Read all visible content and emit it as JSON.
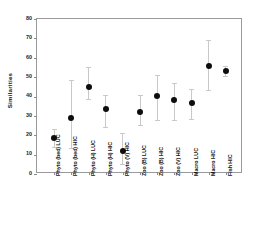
{
  "chart_data": {
    "type": "scatter",
    "title": "",
    "xlabel": "",
    "ylabel": "Similarities",
    "ylim": [
      0,
      80
    ],
    "yticks": [
      0,
      10,
      20,
      30,
      40,
      50,
      60,
      70,
      80
    ],
    "grid": false,
    "legend": "none",
    "error_bars": "vertical, capped, light gray",
    "marker": "filled black circle",
    "categories": [
      "Phyto (bed) LUC",
      "Phyto (bed) HIC",
      "Phyto (H) LUC",
      "Phyto (H) HIC",
      "Phyto (V) HIC",
      "Zoo (B) LUC",
      "Zoo (B) HIC",
      "Zoo (V) HIC",
      "Macro LUC",
      "Macro HIC",
      "Fish HIC"
    ],
    "values": [
      18.5,
      29.0,
      45.0,
      33.5,
      12.0,
      32.0,
      40.5,
      38.0,
      36.5,
      55.5,
      53.0
    ],
    "err_low": [
      14.0,
      13.5,
      38.5,
      24.5,
      5.0,
      25.5,
      28.0,
      28.0,
      28.5,
      43.5,
      50.5
    ],
    "err_high": [
      23.0,
      48.5,
      55.0,
      41.0,
      21.0,
      41.0,
      51.0,
      47.0,
      44.0,
      69.0,
      55.5
    ]
  }
}
